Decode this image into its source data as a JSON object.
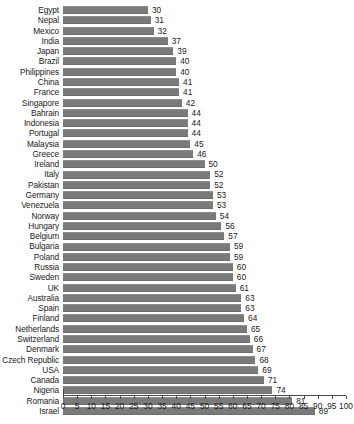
{
  "chart_data": {
    "type": "bar",
    "orientation": "horizontal",
    "title": "",
    "subtitle": "",
    "xlabel": "",
    "ylabel": "",
    "xlim": [
      0,
      100
    ],
    "xtick_step": 5,
    "grid": false,
    "legend": null,
    "bar_color": "#7a7a7a",
    "value_labels_shown": true,
    "xticks": [
      0,
      5,
      10,
      15,
      20,
      25,
      30,
      35,
      40,
      45,
      50,
      55,
      60,
      65,
      70,
      75,
      80,
      85,
      90,
      95,
      100
    ],
    "categories": [
      "Egypt",
      "Nepal",
      "Mexico",
      "India",
      "Japan",
      "Brazil",
      "Philippines",
      "China",
      "France",
      "Singapore",
      "Bahrain",
      "Indonesia",
      "Portugal",
      "Malaysia",
      "Greece",
      "Ireland",
      "Italy",
      "Pakistan",
      "Germany",
      "Venezuela",
      "Norway",
      "Hungary",
      "Belgium",
      "Bulgaria",
      "Poland",
      "Russia",
      "Sweden",
      "UK",
      "Australia",
      "Spain",
      "Finland",
      "Netherlands",
      "Switzerland",
      "Denmark",
      "Czech Republic",
      "USA",
      "Canada",
      "Nigeria",
      "Romania",
      "Israel"
    ],
    "values": [
      30,
      31,
      32,
      37,
      39,
      40,
      40,
      41,
      41,
      42,
      44,
      44,
      44,
      45,
      46,
      50,
      52,
      52,
      53,
      53,
      54,
      56,
      57,
      59,
      59,
      60,
      60,
      61,
      63,
      63,
      64,
      65,
      66,
      67,
      68,
      69,
      71,
      74,
      81,
      89
    ]
  }
}
